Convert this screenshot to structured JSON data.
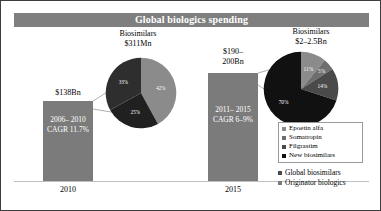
{
  "chart_data": {
    "type": "bar",
    "title": "Global biologics spending",
    "xlabel": "",
    "ylabel": "",
    "grid": false,
    "categories": [
      "2010",
      "2015"
    ],
    "series": [
      {
        "name": "Originator biologics",
        "values": [
          138,
          195
        ],
        "value_labels": [
          "$138Bn",
          "$190–\n200Bn"
        ],
        "annotations": [
          "2006–\n2010\nCAGR\n11.7%",
          "2011–\n2015\nCAGR\n6–9%"
        ],
        "color": "#7b7b7b"
      }
    ],
    "callouts": [
      {
        "name": "biosimilars-2010",
        "title": "Biosimilars\n$311Mn",
        "type": "pie",
        "labels": [
          "Epoetin alfa",
          "Filgrastim",
          "Somatropin"
        ],
        "values": [
          42,
          25,
          33
        ],
        "value_labels": [
          "42%",
          "25%",
          "33%"
        ],
        "colors": [
          "#8b8b8b",
          "#202020",
          "#2e2e2e"
        ]
      },
      {
        "name": "biosimilars-2015",
        "title": "Biosimilars\n$2–2.5Bn",
        "type": "pie",
        "labels": [
          "Epoetin alfa",
          "Somatropin",
          "Filgrastim",
          "New biosimilars"
        ],
        "values": [
          11,
          5,
          14,
          70
        ],
        "value_labels": [
          "11%",
          "5%",
          "14%",
          "70%"
        ],
        "colors": [
          "#8b8b8b",
          "#6e6e6e",
          "#4a4a4a",
          "#111111"
        ]
      }
    ],
    "legends": [
      {
        "name": "pie-legend",
        "boxed": true,
        "entries": [
          {
            "label": "Epoetin alfa",
            "color": "#8b8b8b"
          },
          {
            "label": "Somatropin",
            "color": "#6e6e6e"
          },
          {
            "label": "Filgrastim",
            "color": "#4a4a4a"
          },
          {
            "label": "New biosimilars",
            "color": "#111111"
          }
        ]
      },
      {
        "name": "bar-legend",
        "boxed": false,
        "entries": [
          {
            "label": "Global biosimilars",
            "color": "#4a4a4a"
          },
          {
            "label": "Originator biologics",
            "color": "#7b7b7b"
          }
        ]
      }
    ]
  },
  "header": {
    "title": "Global biologics spending",
    "band_color": "#7f7f7f",
    "text_color": "#ffffff"
  },
  "bars": {
    "left": {
      "value_label": "$138Bn",
      "inner_text": "2006–\n2010\nCAGR\n11.7%",
      "axis_label": "2010"
    },
    "right": {
      "value_label": "$190–\n200Bn",
      "inner_text": "2011–\n2015\nCAGR\n6–9%",
      "axis_label": "2015"
    }
  },
  "pies": {
    "left": {
      "title": "Biosimilars\n$311Mn",
      "slices": [
        {
          "label": "42%",
          "value": 42
        },
        {
          "label": "25%",
          "value": 25
        },
        {
          "label": "33%",
          "value": 33
        }
      ]
    },
    "right": {
      "title": "Biosimilars\n$2–2.5Bn",
      "slices": [
        {
          "label": "11%",
          "value": 11
        },
        {
          "label": "5%",
          "value": 5
        },
        {
          "label": "14%",
          "value": 14
        },
        {
          "label": "70%",
          "value": 70
        }
      ]
    }
  },
  "pie_legend": {
    "items": [
      "Epoetin alfa",
      "Somatropin",
      "Filgrastim",
      "New biosimilars"
    ]
  },
  "bar_legend": {
    "items": [
      "Global biosimilars",
      "Originator biologics"
    ]
  }
}
